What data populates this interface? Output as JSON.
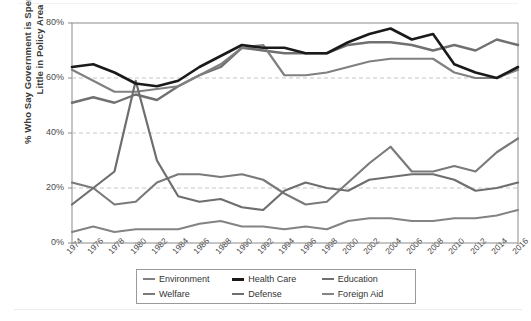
{
  "chart_data": {
    "type": "line",
    "title": "",
    "xlabel": "",
    "ylabel": "% Who Say Government is Spending Too Little in Policy Area",
    "ylim": [
      0,
      80
    ],
    "yticks": [
      "0%",
      "20%",
      "40%",
      "60%",
      "80%"
    ],
    "ytick_values": [
      0,
      20,
      40,
      60,
      80
    ],
    "grid": "horizontal-dashed",
    "legend_position": "bottom-center",
    "x": [
      1974,
      1976,
      1978,
      1980,
      1982,
      1984,
      1986,
      1988,
      1990,
      1992,
      1994,
      1996,
      1998,
      2000,
      2002,
      2004,
      2006,
      2008,
      2010,
      2012,
      2014,
      2016
    ],
    "categories": [
      "1974",
      "1976",
      "1978",
      "1980",
      "1982",
      "1984",
      "1986",
      "1988",
      "1990",
      "1992",
      "1994",
      "1996",
      "1998",
      "2000",
      "2002",
      "2004",
      "2006",
      "2008",
      "2010",
      "2012",
      "2014",
      "2016"
    ],
    "series": [
      {
        "name": "Environment",
        "color": "#808080",
        "width": 2.2,
        "values": [
          63,
          59,
          55,
          55,
          56,
          57,
          61,
          65,
          71,
          72,
          61,
          61,
          62,
          64,
          66,
          67,
          67,
          67,
          62,
          60,
          60,
          63
        ]
      },
      {
        "name": "Health Care",
        "color": "#1a1a1a",
        "width": 2.6,
        "values": [
          64,
          65,
          62,
          58,
          57,
          59,
          64,
          68,
          72,
          71,
          71,
          69,
          69,
          73,
          76,
          78,
          74,
          76,
          65,
          62,
          60,
          64
        ]
      },
      {
        "name": "Education",
        "color": "#707070",
        "width": 2.4,
        "values": [
          51,
          53,
          51,
          54,
          52,
          57,
          61,
          64,
          71,
          70,
          69,
          69,
          69,
          72,
          73,
          73,
          72,
          70,
          72,
          70,
          74,
          72
        ]
      },
      {
        "name": "Welfare",
        "color": "#7a7a7a",
        "width": 2.2,
        "values": [
          22,
          20,
          14,
          15,
          22,
          25,
          25,
          24,
          25,
          23,
          18,
          14,
          15,
          22,
          29,
          35,
          26,
          26,
          28,
          26,
          33,
          38
        ]
      },
      {
        "name": "Defense",
        "color": "#6e6e6e",
        "width": 2.2,
        "values": [
          14,
          20,
          26,
          59,
          30,
          17,
          15,
          16,
          13,
          12,
          19,
          22,
          20,
          19,
          23,
          24,
          25,
          25,
          23,
          19,
          20,
          22
        ]
      },
      {
        "name": "Foreign Aid",
        "color": "#838383",
        "width": 2.0,
        "values": [
          4,
          6,
          4,
          5,
          5,
          5,
          7,
          8,
          6,
          6,
          5,
          6,
          5,
          8,
          9,
          9,
          8,
          8,
          9,
          9,
          10,
          12
        ]
      }
    ]
  },
  "legend": {
    "items": [
      {
        "label": "Environment"
      },
      {
        "label": "Health Care"
      },
      {
        "label": "Education"
      },
      {
        "label": "Welfare"
      },
      {
        "label": "Defense"
      },
      {
        "label": "Foreign Aid"
      }
    ]
  }
}
